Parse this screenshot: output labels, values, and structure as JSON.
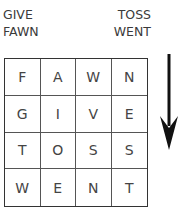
{
  "clues": {
    "left": [
      "GIVE",
      "FAWN"
    ],
    "right": [
      "TOSS",
      "WENT"
    ]
  },
  "grid": {
    "rows": [
      [
        "F",
        "A",
        "W",
        "N"
      ],
      [
        "G",
        "I",
        "V",
        "E"
      ],
      [
        "T",
        "O",
        "S",
        "S"
      ],
      [
        "W",
        "E",
        "N",
        "T"
      ]
    ]
  },
  "arrow": {
    "icon": "arrow-down-icon",
    "color": "#111111"
  }
}
